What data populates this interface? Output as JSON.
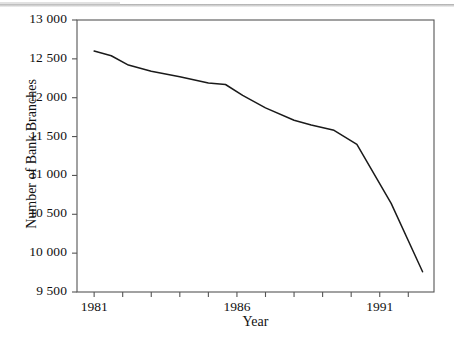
{
  "figure": {
    "background_color": "#ffffff",
    "line_color": "#1a1a1a",
    "axis_color": "#555555",
    "scan_artifact": "horizontal-rule-top"
  },
  "axis_titles": {
    "y": "Number of Bank Branches",
    "x": "Year"
  },
  "y_tick_labels": [
    "13 000",
    "12 500",
    "12 000",
    "11 500",
    "11 000",
    "10 500",
    "10 000",
    "9 500"
  ],
  "x_tick_labels": [
    "1981",
    "1986",
    "1991"
  ],
  "chart_data": {
    "type": "line",
    "title": "",
    "xlabel": "Year",
    "ylabel": "Number of Bank Branches",
    "xlim": [
      1980.4,
      1992.9
    ],
    "ylim": [
      9500,
      13000
    ],
    "ytick_values": [
      9500,
      10000,
      10500,
      11000,
      11500,
      12000,
      12500,
      13000
    ],
    "ytick_labels": [
      "9 500",
      "10 000",
      "10 500",
      "11 000",
      "11 500",
      "12 000",
      "12 500",
      "13 000"
    ],
    "xtick_values": [
      1981,
      1982,
      1983,
      1984,
      1985,
      1986,
      1987,
      1988,
      1989,
      1990,
      1991,
      1992
    ],
    "xtick_labeled": [
      1981,
      1986,
      1991
    ],
    "grid": false,
    "legend": null,
    "series": [
      {
        "name": "Number of Bank Branches",
        "x": [
          1981.0,
          1981.6,
          1982.2,
          1983.0,
          1984.0,
          1985.0,
          1985.6,
          1986.2,
          1987.0,
          1988.0,
          1988.6,
          1989.4,
          1990.2,
          1991.4,
          1992.5
        ],
        "values": [
          12600,
          12540,
          12420,
          12340,
          12270,
          12190,
          12170,
          12030,
          11870,
          11710,
          11650,
          11580,
          11400,
          10640,
          9760
        ]
      }
    ]
  }
}
